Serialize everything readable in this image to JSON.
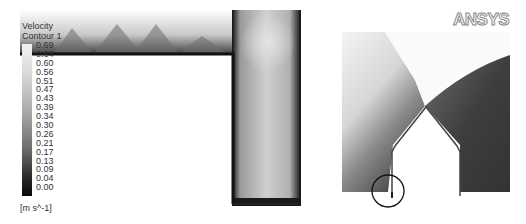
{
  "legend": {
    "title_line1": "Velocity",
    "title_line2": "Contour 1",
    "values": [
      "0.69",
      "0.64",
      "0.60",
      "0.56",
      "0.51",
      "0.47",
      "0.43",
      "0.39",
      "0.34",
      "0.30",
      "0.26",
      "0.21",
      "0.17",
      "0.13",
      "0.09",
      "0.04",
      "0.00"
    ],
    "unit": "[m s^-1]"
  },
  "logo": {
    "text": "ANSYS"
  },
  "colors": {
    "max": "#f2f2f2",
    "min": "#080808",
    "wall": "#111111",
    "background": "#ffffff"
  }
}
